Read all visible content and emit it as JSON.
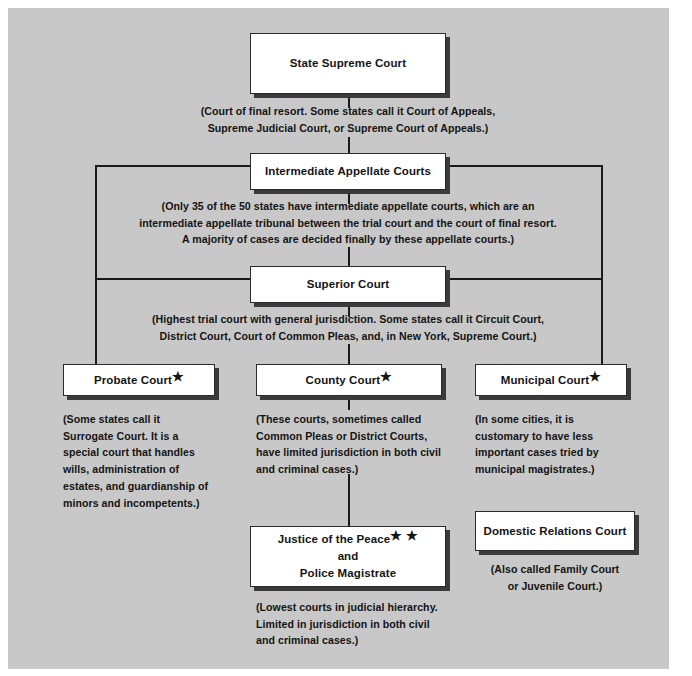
{
  "diagram": {
    "background_color": "#c8c8c8",
    "box_fill": "#ffffff",
    "line_color": "#1a1a1a",
    "text_color": "#141414"
  },
  "nodes": {
    "state_supreme_court": {
      "label": "State Supreme Court"
    },
    "intermediate_appellate_courts": {
      "label": "Intermediate Appellate Courts"
    },
    "superior_court": {
      "label": "Superior Court"
    },
    "probate_court": {
      "label": "Probate Court",
      "marker": "★"
    },
    "county_court": {
      "label": "County Court",
      "marker": "★"
    },
    "municipal_court": {
      "label": "Municipal Court",
      "marker": "★"
    },
    "justice_of_the_peace": {
      "line1": "Justice of the Peace",
      "marker": "★ ★",
      "line2": "and",
      "line3": "Police Magistrate"
    },
    "domestic_relations_court": {
      "label": "Domestic Relations Court"
    }
  },
  "notes": {
    "state_supreme_court": "(Court of final resort.  Some states call it Court of Appeals,\nSupreme Judicial Court, or Supreme Court of Appeals.)",
    "intermediate_appellate_courts": "(Only 35 of the 50 states have intermediate appellate courts, which are an\nintermediate appellate tribunal between the trial court and the court of final resort.\nA majority of cases are decided finally by these appellate courts.)",
    "superior_court": "(Highest trial court with general jurisdiction.  Some states call it Circuit Court,\nDistrict Court, Court of Common Pleas, and, in New York, Supreme Court.)",
    "probate_court": " (Some states call it\nSurrogate Court.  It is a\nspecial court that handles\nwills, administration of\nestates, and guardianship of\nminors and incompetents.)",
    "county_court": " (These courts, sometimes called\nCommon Pleas or District Courts,\nhave limited jurisdiction in both civil\nand criminal cases.)",
    "municipal_court": " (In some cities, it is\ncustomary to have less\nimportant cases tried by\nmunicipal magistrates.)",
    "justice_of_the_peace": " (Lowest courts in judicial hierarchy.\nLimited in jurisdiction in both civil\nand criminal cases.)",
    "domestic_relations_court": "(Also called Family Court\nor Juvenile Court.)"
  }
}
